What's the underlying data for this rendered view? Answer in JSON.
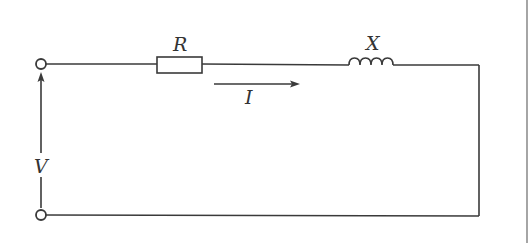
{
  "diagram": {
    "type": "series RL circuit",
    "stroke_color": "#3a3a3a",
    "background": "#ffffff",
    "labels": {
      "resistor": "R",
      "inductor": "X",
      "current": "I",
      "voltage": "V"
    },
    "components": [
      {
        "id": "terminal-top",
        "kind": "terminal"
      },
      {
        "id": "resistor",
        "kind": "resistor",
        "label": "R"
      },
      {
        "id": "inductor",
        "kind": "inductor",
        "label": "X"
      },
      {
        "id": "terminal-bottom",
        "kind": "terminal"
      }
    ],
    "annotations": [
      {
        "id": "current-arrow",
        "label": "I",
        "direction": "right"
      },
      {
        "id": "voltage-arrow",
        "label": "V",
        "direction": "up"
      }
    ]
  }
}
